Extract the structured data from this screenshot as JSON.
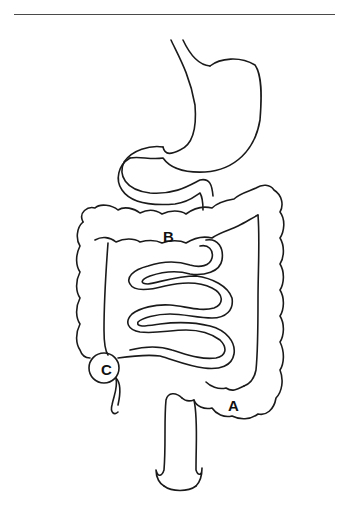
{
  "diagram": {
    "type": "anatomical line drawing",
    "parts": [
      "esophagus",
      "stomach",
      "duodenum",
      "small-intestine",
      "large-intestine",
      "appendix",
      "rectum"
    ],
    "labels": [
      {
        "id": "A",
        "text": "A",
        "x": 228,
        "y": 398
      },
      {
        "id": "B",
        "text": "B",
        "x": 163,
        "y": 229
      },
      {
        "id": "C",
        "text": "C",
        "x": 101,
        "y": 362
      }
    ],
    "line_color": "#1a1a1a",
    "background": "#ffffff"
  }
}
